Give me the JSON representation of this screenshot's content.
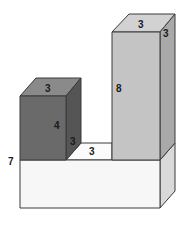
{
  "figure": {
    "type": "3d-block-solid",
    "colors": {
      "base_front": "#f7f7f7",
      "base_side": "#d9d9d9",
      "base_top": "#fbfbfb",
      "dark_front": "#6a6a6a",
      "dark_top": "#8a8a8a",
      "dark_side": "#555555",
      "tall_front": "#c4c4c4",
      "tall_top": "#d2d2d2",
      "tall_side": "#a9a9a9",
      "edge": "#3a3a3a"
    },
    "labels": {
      "base_height": "7",
      "dark_block_top_width": "3",
      "dark_block_height": "4",
      "dark_block_depth": "3",
      "gap_width": "3",
      "tall_block_height": "8",
      "tall_block_top_width": "3",
      "tall_block_depth": "3"
    }
  }
}
